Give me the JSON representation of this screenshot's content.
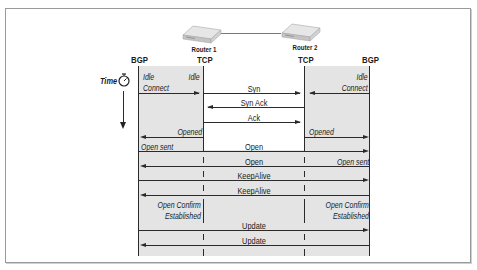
{
  "routers": [
    {
      "name": "Router 1",
      "left_stack": "BGP",
      "right_stack": "TCP"
    },
    {
      "name": "Router 2",
      "left_stack": "TCP",
      "right_stack": "BGP"
    }
  ],
  "time_label": "Time",
  "icons": {
    "time": "stopwatch-icon",
    "router": "router-device-icon"
  },
  "states": {
    "r1_idle": "Idle",
    "r1_connect": "Connect",
    "r2_idle": "Idle",
    "r2_connect": "Connect",
    "r1_opened": "Opened",
    "r2_opened": "Opened",
    "r1_open_sent": "Open sent",
    "r2_open_sent": "Open sent",
    "r1_open_confirm": "Open Confirm",
    "r1_established": "Established",
    "r2_open_confirm": "Open Confirm",
    "r2_established": "Established"
  },
  "messages": [
    {
      "label": "Syn",
      "direction": "right"
    },
    {
      "label": "Syn Ack",
      "direction": "left"
    },
    {
      "label": "Ack",
      "direction": "right"
    },
    {
      "label": "Open",
      "direction": "right"
    },
    {
      "label": "Open",
      "direction": "left"
    },
    {
      "label": "KeepAlive",
      "direction": "right"
    },
    {
      "label": "KeepAlive",
      "direction": "left"
    },
    {
      "label": "Update",
      "direction": "right"
    },
    {
      "label": "Update",
      "direction": "left"
    }
  ],
  "colors": {
    "lane_shade": "#e4e4e4",
    "line": "#2a2a2a",
    "frame": "#9a9a9a"
  }
}
